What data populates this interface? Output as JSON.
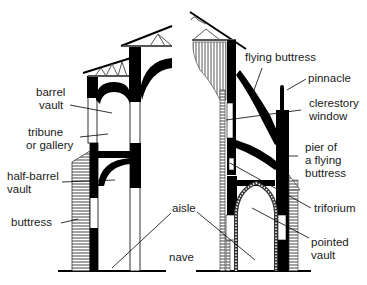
{
  "diagram": {
    "type": "architectural cross-section comparison",
    "left_section": "Romanesque church cross-section",
    "right_section": "Gothic cathedral cross-section",
    "colors": {
      "ink": "#000000",
      "text": "#1a1a1a",
      "hatch": "#555555",
      "background": "#ffffff"
    }
  },
  "labels": {
    "barrel_vault": [
      "barrel",
      "vault"
    ],
    "tribune": [
      "tribune",
      "or gallery"
    ],
    "half_barrel_vault": [
      "half-barrel",
      "vault"
    ],
    "buttress": [
      "buttress"
    ],
    "aisle": [
      "aisle"
    ],
    "nave": [
      "nave"
    ],
    "flying_buttress": [
      "flying buttress"
    ],
    "pinnacle": [
      "pinnacle"
    ],
    "clerestory_window": [
      "clerestory",
      "window"
    ],
    "pier_of_flying_buttress": [
      "pier of",
      "a flying",
      "buttress"
    ],
    "triforium": [
      "triforium"
    ],
    "pointed_vault": [
      "pointed",
      "vault"
    ]
  }
}
